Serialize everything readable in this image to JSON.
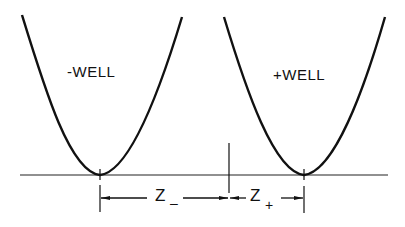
{
  "diagram": {
    "wells": [
      {
        "label": "-WELL",
        "sign": "negative"
      },
      {
        "label": "+WELL",
        "sign": "positive"
      }
    ],
    "dimensions": [
      {
        "label": "Z",
        "subscript": "–"
      },
      {
        "label": "Z",
        "subscript": "+"
      }
    ],
    "colors": {
      "stroke": "#111111",
      "background": "#ffffff"
    }
  }
}
